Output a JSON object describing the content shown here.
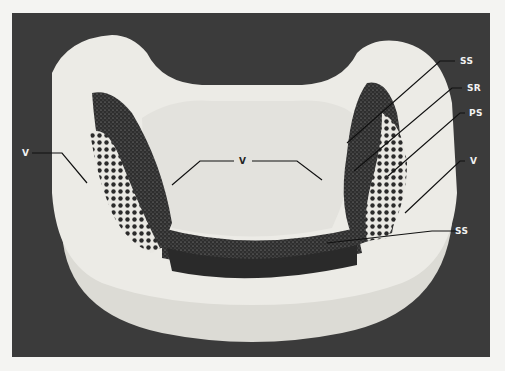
{
  "figure": {
    "colors": {
      "page_background": "#f4f4f2",
      "photo_background": "#3b3b3b",
      "cast": "#ecebe6",
      "stipple": "#2b2b2b"
    },
    "labels": [
      {
        "id": "ss-top",
        "text": "SS"
      },
      {
        "id": "sr",
        "text": "SR"
      },
      {
        "id": "ps",
        "text": "PS"
      },
      {
        "id": "v-right",
        "text": "V"
      },
      {
        "id": "ss-bottom",
        "text": "SS"
      },
      {
        "id": "v-left",
        "text": "V"
      },
      {
        "id": "v-center",
        "text": "V"
      }
    ]
  }
}
